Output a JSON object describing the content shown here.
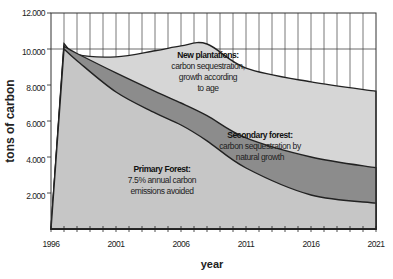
{
  "chart_data": {
    "type": "area",
    "title": "",
    "xlabel": "year",
    "ylabel": "tons of carbon",
    "ylim": [
      0,
      12000
    ],
    "xlim": [
      1996,
      2021
    ],
    "grid": {
      "vertical": true,
      "horizontal_at": [
        10000,
        12000
      ]
    },
    "y_ticks": [
      "2.000",
      "4.000",
      "6.000",
      "8.000",
      "10.000",
      "12.000"
    ],
    "x_ticks": [
      "1996",
      "2001",
      "2006",
      "2011",
      "2016",
      "2021"
    ],
    "x": [
      1996,
      1997,
      1998,
      2001,
      2004,
      2006,
      2008,
      2011,
      2016,
      2021
    ],
    "series": [
      {
        "name": "New plantations",
        "description": "carbon sequestration, growth according to age",
        "color": "#d4d4d4",
        "values": [
          0,
          10300,
          9700,
          9560,
          9900,
          10170,
          10280,
          8940,
          8170,
          7650
        ]
      },
      {
        "name": "Secondary forest",
        "description": "carbon sequestration by natural growth",
        "color": "#8f8f8f",
        "values": [
          0,
          10150,
          9750,
          8670,
          7650,
          7000,
          6300,
          5060,
          4000,
          3400
        ]
      },
      {
        "name": "Primary Forest",
        "description": "7.5% annual carbon emissions avoided",
        "color": "#c8c8c8",
        "values": [
          0,
          10000,
          9350,
          7610,
          6450,
          5780,
          4900,
          3390,
          1890,
          1440
        ]
      }
    ],
    "annotations": [
      {
        "title": "New plantations:",
        "lines": [
          "carbon sequestration,",
          "growth according",
          "to age"
        ]
      },
      {
        "title": "Secondary forest:",
        "lines": [
          "carbon sequestration by",
          "natural growth"
        ]
      },
      {
        "title": "Primary Forest:",
        "lines": [
          "7.5% annual carbon",
          "emissions avoided"
        ]
      }
    ]
  }
}
